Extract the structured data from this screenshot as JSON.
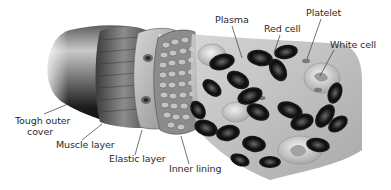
{
  "diagram": {
    "colors": {
      "background": "#ffffff",
      "label_text": "#2a2a2a",
      "leader_line": "#3a3a3a",
      "outer_cover_dark": "#1a1a1a",
      "muscle_band": "#5a5a5a",
      "elastic_layer": "#b8b8b8",
      "inner_lining": "#9a9a9a",
      "red_cell": "#151515",
      "white_cell": "#d8d8d8"
    },
    "labels": {
      "plasma": "Plasma",
      "red_cell": "Red cell",
      "platelet": "Platelet",
      "white_cell": "White cell",
      "tough_outer_cover_line1": "Tough outer",
      "tough_outer_cover_line2": "cover",
      "muscle_layer": "Muscle layer",
      "elastic_layer": "Elastic layer",
      "inner_lining": "Inner lining"
    }
  }
}
